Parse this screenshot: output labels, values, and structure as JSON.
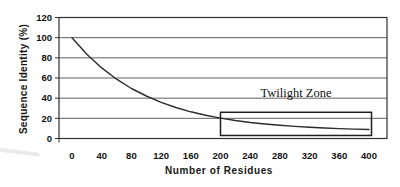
{
  "chart_data": {
    "type": "line",
    "title": "",
    "xlabel": "Number of Residues",
    "ylabel": "Sequence Identity (%)",
    "x_ticks": [
      0,
      40,
      80,
      120,
      160,
      200,
      240,
      280,
      320,
      360,
      400
    ],
    "y_ticks": [
      0,
      20,
      40,
      60,
      80,
      100,
      120
    ],
    "xlim": [
      0,
      400
    ],
    "ylim": [
      0,
      120
    ],
    "grid": "horizontal",
    "legend": "none",
    "series": [
      {
        "name": "sequence-identity-vs-length",
        "x": [
          0,
          20,
          40,
          60,
          80,
          100,
          120,
          140,
          160,
          180,
          200,
          220,
          240,
          260,
          280,
          300,
          320,
          340,
          360,
          380,
          400
        ],
        "y": [
          100,
          83.5,
          70,
          58.8,
          49.6,
          42.1,
          35.8,
          30.7,
          26.5,
          23.1,
          20.2,
          17.9,
          15.9,
          14.4,
          13.1,
          12,
          11.1,
          10.4,
          9.8,
          9.3,
          8.9
        ]
      }
    ],
    "annotations": {
      "twilight_zone": {
        "label": "Twilight Zone",
        "box_x_range": [
          200,
          400
        ],
        "box_y_range": [
          3,
          26
        ]
      }
    }
  },
  "colors": {
    "background": "#ffffff",
    "axis": "#2f2f2f",
    "grid": "#4f4f4f",
    "curve": "#2c2c2c",
    "box": "#1f1f1f",
    "text": "#111111"
  }
}
